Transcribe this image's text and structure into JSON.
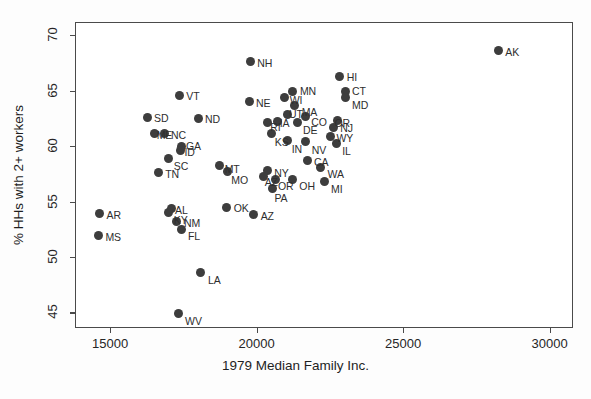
{
  "chart_data": {
    "type": "scatter",
    "title": "",
    "xlabel": "1979 Median Family Inc.",
    "ylabel": "% HHs with 2+ workers",
    "xlim": [
      13800,
      30800
    ],
    "ylim": [
      43.6,
      71.2
    ],
    "xticks": [
      15000,
      20000,
      25000,
      30000
    ],
    "yticks": [
      45,
      50,
      55,
      60,
      65,
      70
    ],
    "xticklabels": [
      "15000",
      "20000",
      "25000",
      "30000"
    ],
    "yticklabels": [
      "45",
      "50",
      "55",
      "60",
      "65",
      "70"
    ],
    "grid": false,
    "legend": false,
    "marker_color": "#3d3d3d",
    "frame_color": "#4a4a4a",
    "points": [
      {
        "label": "AK",
        "x": 28250,
        "y": 68.6,
        "lx": 7,
        "ly": -4
      },
      {
        "label": "NH",
        "x": 19780,
        "y": 67.6,
        "lx": 7,
        "ly": -4
      },
      {
        "label": "HI",
        "x": 22840,
        "y": 66.3,
        "lx": 7,
        "ly": -4
      },
      {
        "label": "MN",
        "x": 21240,
        "y": 64.9,
        "lx": 7,
        "ly": -6
      },
      {
        "label": "CT",
        "x": 23020,
        "y": 64.9,
        "lx": 7,
        "ly": -6
      },
      {
        "label": "MD",
        "x": 23020,
        "y": 64.4,
        "lx": 7,
        "ly": 3
      },
      {
        "label": "VT",
        "x": 17360,
        "y": 64.6,
        "lx": 7,
        "ly": -4
      },
      {
        "label": "WI",
        "x": 20960,
        "y": 64.4,
        "lx": 5,
        "ly": -2
      },
      {
        "label": "NE",
        "x": 19740,
        "y": 64.0,
        "lx": 7,
        "ly": -4
      },
      {
        "label": "MA",
        "x": 21300,
        "y": 63.7,
        "lx": 7,
        "ly": 2
      },
      {
        "label": "UT",
        "x": 21040,
        "y": 62.9,
        "lx": 2,
        "ly": -5
      },
      {
        "label": "CO",
        "x": 21660,
        "y": 62.7,
        "lx": 6,
        "ly": 1
      },
      {
        "label": "SD",
        "x": 16260,
        "y": 62.6,
        "lx": 7,
        "ly": -4
      },
      {
        "label": "ND",
        "x": 18000,
        "y": 62.5,
        "lx": 7,
        "ly": -4
      },
      {
        "label": "OR",
        "x": 22760,
        "y": 62.3,
        "lx": -3,
        "ly": -3
      },
      {
        "label": "RI",
        "x": 20360,
        "y": 62.1,
        "lx": 3,
        "ly": -1
      },
      {
        "label": "IA",
        "x": 20720,
        "y": 62.2,
        "lx": 2,
        "ly": 0
      },
      {
        "label": "DE",
        "x": 21380,
        "y": 62.1,
        "lx": 6,
        "ly": 2
      },
      {
        "label": "NJ",
        "x": 22620,
        "y": 61.7,
        "lx": 7,
        "ly": -4
      },
      {
        "label": "ME",
        "x": 16520,
        "y": 61.1,
        "lx": 2,
        "ly": -4
      },
      {
        "label": "NC",
        "x": 16840,
        "y": 61.1,
        "lx": 7,
        "ly": -4
      },
      {
        "label": "KS",
        "x": 20520,
        "y": 61.1,
        "lx": 3,
        "ly": 3
      },
      {
        "label": "IN",
        "x": 21060,
        "y": 60.5,
        "lx": 4,
        "ly": 3
      },
      {
        "label": "NV",
        "x": 21680,
        "y": 60.4,
        "lx": 6,
        "ly": 3
      },
      {
        "label": "WY",
        "x": 22520,
        "y": 60.9,
        "lx": 6,
        "ly": -3
      },
      {
        "label": "IL",
        "x": 22720,
        "y": 60.2,
        "lx": 6,
        "ly": 2
      },
      {
        "label": "GA",
        "x": 17420,
        "y": 60.0,
        "lx": 5,
        "ly": -5
      },
      {
        "label": "ID",
        "x": 17400,
        "y": 59.6,
        "lx": 4,
        "ly": 0
      },
      {
        "label": "SC",
        "x": 17000,
        "y": 58.9,
        "lx": 5,
        "ly": 3
      },
      {
        "label": "CA",
        "x": 21720,
        "y": 58.7,
        "lx": 7,
        "ly": -4
      },
      {
        "label": "MT",
        "x": 18740,
        "y": 58.3,
        "lx": 5,
        "ly": -1
      },
      {
        "label": "WA",
        "x": 22180,
        "y": 58.1,
        "lx": 7,
        "ly": 2
      },
      {
        "label": "TN",
        "x": 16640,
        "y": 57.6,
        "lx": 7,
        "ly": -4
      },
      {
        "label": "MO",
        "x": 19000,
        "y": 57.7,
        "lx": 4,
        "ly": 3
      },
      {
        "label": "NY",
        "x": 20360,
        "y": 57.8,
        "lx": 7,
        "ly": -3
      },
      {
        "label": "AZ",
        "x": 20240,
        "y": 57.3,
        "lx": 1,
        "ly": 1
      },
      {
        "label": "OR2",
        "x": 20660,
        "y": 57.0,
        "lx": 2,
        "ly": 2
      },
      {
        "label": "OH",
        "x": 21220,
        "y": 57.0,
        "lx": 7,
        "ly": 2
      },
      {
        "label": "MI",
        "x": 22300,
        "y": 56.8,
        "lx": 7,
        "ly": 2
      },
      {
        "label": "PA",
        "x": 20540,
        "y": 56.2,
        "lx": 2,
        "ly": 5
      },
      {
        "label": "AL",
        "x": 17080,
        "y": 54.4,
        "lx": 4,
        "ly": -3
      },
      {
        "label": "KY",
        "x": 17000,
        "y": 54.0,
        "lx": 5,
        "ly": 2
      },
      {
        "label": "OK",
        "x": 18980,
        "y": 54.5,
        "lx": 7,
        "ly": -4
      },
      {
        "label": "AR",
        "x": 14640,
        "y": 53.9,
        "lx": 7,
        "ly": -4
      },
      {
        "label": "AZ2",
        "x": 19900,
        "y": 53.8,
        "lx": 7,
        "ly": -4
      },
      {
        "label": "NM",
        "x": 17280,
        "y": 53.2,
        "lx": 7,
        "ly": 0
      },
      {
        "label": "FL",
        "x": 17420,
        "y": 52.5,
        "lx": 7,
        "ly": 2
      },
      {
        "label": "MS",
        "x": 14600,
        "y": 51.9,
        "lx": 7,
        "ly": -4
      },
      {
        "label": "LA",
        "x": 18100,
        "y": 48.6,
        "lx": 7,
        "ly": 2
      },
      {
        "label": "WV",
        "x": 17320,
        "y": 44.9,
        "lx": 7,
        "ly": 2
      }
    ]
  }
}
